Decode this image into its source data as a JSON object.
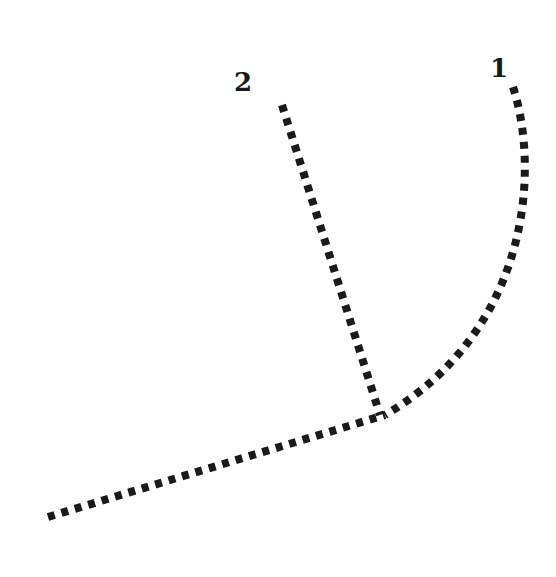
{
  "diagram": {
    "labels": {
      "path_1": "1",
      "path_2": "2"
    },
    "paths": [
      {
        "id": "1",
        "kind": "curve",
        "description": "curved dotted path rising to upper right"
      },
      {
        "id": "2",
        "kind": "straight",
        "description": "straight dotted path rising to upper left"
      },
      {
        "id": "base",
        "kind": "straight",
        "description": "dotted base path from lower left to junction"
      }
    ],
    "colors": {
      "stroke": "#1a1a1a",
      "background": "#ffffff"
    }
  }
}
